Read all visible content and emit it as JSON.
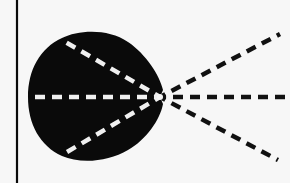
{
  "canvas": {
    "width": 290,
    "height": 183,
    "background": "#f7f7f7"
  },
  "colors": {
    "ink": "#0a0a0a",
    "dash_on_blob": "#f0f0f0",
    "dash_outside": "#111111"
  },
  "diagram": {
    "type": "ray-diagram",
    "vertical_line": {
      "x": 17,
      "y1": 0,
      "y2": 183,
      "width": 2.2
    },
    "blob": {
      "description": "dark rounded lens/eye-like shape (large left lobe plus right lobe tapering to a focal point)",
      "left_lobe": {
        "cx": 72,
        "cy": 97,
        "r": 44
      },
      "right_lobe": {
        "cx": 118,
        "cy": 92,
        "rx": 48,
        "ry": 55
      }
    },
    "focal_point": {
      "x": 160,
      "y": 97
    },
    "rays_inside": [
      {
        "label": "upper",
        "x1": 160,
        "y1": 97,
        "x2": 62,
        "y2": 40
      },
      {
        "label": "middle",
        "x1": 160,
        "y1": 97,
        "x2": 28,
        "y2": 97
      },
      {
        "label": "lower",
        "x1": 160,
        "y1": 97,
        "x2": 62,
        "y2": 155
      }
    ],
    "rays_outside": [
      {
        "label": "upper",
        "x1": 160,
        "y1": 97,
        "x2": 280,
        "y2": 34
      },
      {
        "label": "middle",
        "x1": 160,
        "y1": 97,
        "x2": 290,
        "y2": 97
      },
      {
        "label": "lower",
        "x1": 160,
        "y1": 97,
        "x2": 278,
        "y2": 160
      }
    ],
    "dash_pattern": {
      "dash": 10,
      "gap": 7,
      "width": 4.5
    }
  }
}
